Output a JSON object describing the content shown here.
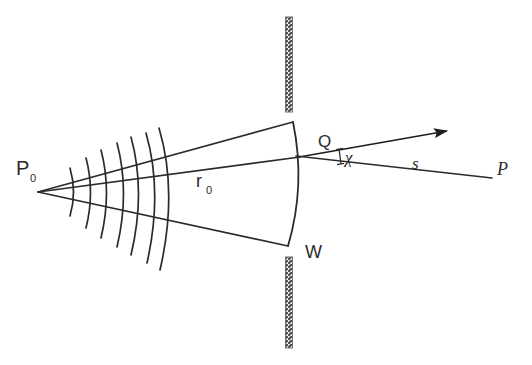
{
  "figure": {
    "domain_kind": "diagram",
    "background_color": "#ffffff",
    "stroke_color": "#2b2b2b",
    "barrier_fill": "#8f8f8f",
    "width": 532,
    "height": 365
  },
  "labels": {
    "source_point": "P",
    "source_point_sub": "0",
    "radius": "r",
    "radius_sub": "0",
    "aperture_point": "Q",
    "angle": "χ",
    "distance": "s",
    "observation_point": "P",
    "wavefront": "W"
  },
  "geometry": {
    "source": {
      "x": 38,
      "y": 192
    },
    "aperture_point_Q": {
      "x": 298,
      "y": 157
    },
    "observation_point_P": {
      "x": 492,
      "y": 178
    },
    "arrow_tip": {
      "x": 447,
      "y": 131
    },
    "barrier_x": 289,
    "barrier_top_segment": {
      "y1": 17,
      "y2": 112
    },
    "barrier_bottom_segment": {
      "y1": 257,
      "y2": 348
    },
    "aperture_top_edge": {
      "x": 293,
      "y": 122
    },
    "aperture_bottom_edge": {
      "x": 288,
      "y": 246
    },
    "wavefront_arc_count": 7,
    "ray_count": 3
  },
  "elements": [
    {
      "name": "source-point-label",
      "text": "P0"
    },
    {
      "name": "radius-label",
      "text": "r0"
    },
    {
      "name": "aperture-point-label",
      "text": "Q"
    },
    {
      "name": "angle-label",
      "text": "χ"
    },
    {
      "name": "distance-label",
      "text": "s"
    },
    {
      "name": "observation-point-label",
      "text": "P"
    },
    {
      "name": "wavefront-label",
      "text": "W"
    }
  ]
}
